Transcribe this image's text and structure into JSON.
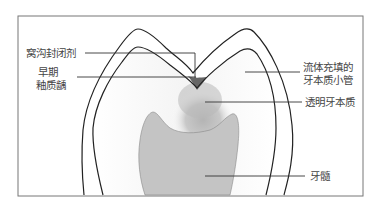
{
  "labels": {
    "sealant": "窝沟封闭剂",
    "early_caries_l1": "早期",
    "early_caries_l2": "釉质龋",
    "tubules_l1": "流体充填的",
    "tubules_l2": "牙本质小管",
    "sclerotic": "透明牙本质",
    "pulp": "牙髓"
  },
  "colors": {
    "frame": "#777777",
    "outline": "#222222",
    "sealant": "#666666",
    "lesion": "#bdbdbd",
    "pulp": "#c4c4c4",
    "leader": "#333333",
    "text": "#444444"
  }
}
